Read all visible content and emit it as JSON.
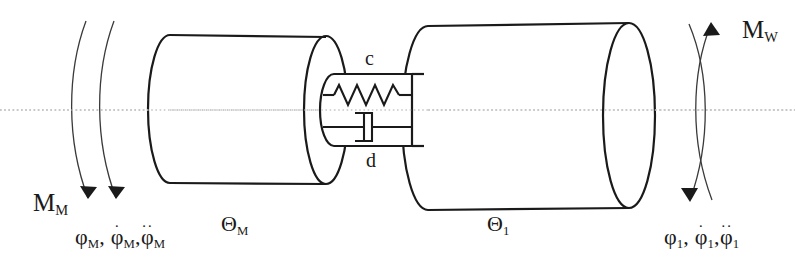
{
  "diagram": {
    "type": "mechanical-schematic",
    "centerline_y": 110,
    "colors": {
      "stroke": "#1a1a1a",
      "thin_stroke": "#3a3a3a",
      "centerline": "#b9b9b9",
      "background": "#ffffff",
      "text": "#1a1a1a"
    },
    "motor": {
      "inertia_symbol": "Θ",
      "inertia_subscript": "M",
      "torque_symbol": "M",
      "torque_subscript": "M",
      "angle_symbol": "φ",
      "angle_subscript": "M",
      "derivative_dot": "·",
      "derivative_ddot": "··",
      "comma": ",",
      "kinematics_label": "φ_M, φ̇_M, φ̈_M"
    },
    "load": {
      "inertia_symbol": "Θ",
      "inertia_subscript": "1",
      "torque_symbol": "M",
      "torque_subscript": "W",
      "angle_symbol": "φ",
      "angle_subscript": "1",
      "derivative_dot": "·",
      "derivative_ddot": "··",
      "comma": ",",
      "kinematics_label": "φ_1, φ̇_1, φ̈_1"
    },
    "coupling": {
      "spring_label": "c",
      "damper_label": "d",
      "spring_name": "torsional-stiffness",
      "damper_name": "torsional-damping",
      "spring_coils": 8
    },
    "icons": {
      "spring": "spring-icon",
      "damper": "dashpot-icon",
      "torque_arrow": "curved-arrow-icon",
      "centerline": "axis-centerline-icon"
    }
  }
}
